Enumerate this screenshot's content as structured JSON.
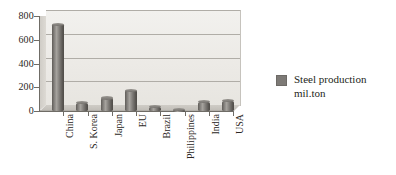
{
  "chart_data": {
    "type": "bar",
    "title": "",
    "subtitle": "",
    "xlabel": "",
    "ylabel": "",
    "ylim": [
      0,
      800
    ],
    "yticks": [
      0,
      200,
      400,
      600,
      800
    ],
    "grid": true,
    "legend_position": "right",
    "style": "3d-cylinder",
    "categories": [
      "China",
      "S. Korea",
      "Japan",
      "EU",
      "Brazil",
      "Philippines",
      "India",
      "USA"
    ],
    "series": [
      {
        "name": "Steel production\nmil.ton",
        "values": [
          730,
          70,
          110,
          175,
          35,
          10,
          80,
          85
        ]
      }
    ]
  },
  "axis": {
    "y_tick_labels": [
      "800",
      "600",
      "400",
      "200",
      "0"
    ]
  },
  "legend": {
    "entries": [
      {
        "label_line1": "Steel production",
        "label_line2": "mil.ton",
        "color": "#7d7a76"
      }
    ]
  },
  "colors": {
    "bar": "#6b6866",
    "plot_background": "#eceae6",
    "gridline": "#b0ada7",
    "axis": "#6f6c66",
    "text": "#231f20"
  }
}
